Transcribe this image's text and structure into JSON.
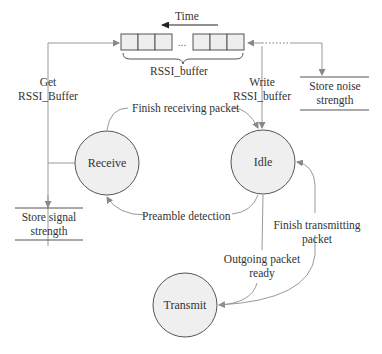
{
  "diagram": {
    "time_label": "Time",
    "buffer_label": "RSSI_buffer",
    "buffer_ellipsis": "...",
    "states": {
      "receive": "Receive",
      "idle": "Idle",
      "transmit": "Transmit"
    },
    "stores": {
      "signal": {
        "line1": "Store signal",
        "line2": "strength"
      },
      "noise": {
        "line1": "Store noise",
        "line2": "strength"
      }
    },
    "edges": {
      "get_buffer": {
        "line1": "Get",
        "line2": "RSSI_Buffer"
      },
      "write_buffer": {
        "line1": "Write",
        "line2": "RSSI_buffer"
      },
      "finish_receiving": "Finish receiving packet",
      "preamble_detection": "Preamble detection",
      "outgoing_packet": {
        "line1": "Outgoing packet",
        "line2": "ready"
      },
      "finish_transmitting": {
        "line1": "Finish transmitting",
        "line2": "packet"
      }
    },
    "colors": {
      "line": "#999999",
      "state_fill": "#efefef",
      "state_stroke": "#555555",
      "cell_fill": "#eeeeee"
    }
  }
}
